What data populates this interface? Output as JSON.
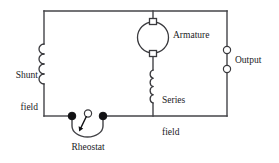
{
  "diagram": {
    "type": "electrical-schematic",
    "background_color": "#ffffff",
    "wire_color": "#444448",
    "ink_color": "#1a1a1e",
    "node_color": "#111114",
    "labels": {
      "shunt_field_line1": "Shunt",
      "shunt_field_line2": "field",
      "armature": "Armature",
      "series_field_line1": "Series",
      "series_field_line2": "field",
      "output": "Output",
      "rheostat": "Rheostat"
    },
    "components": [
      {
        "name": "shunt-field-coil",
        "label": "Shunt field",
        "kind": "inductor-coil",
        "turns": 4,
        "orientation": "vertical",
        "bump_side": "left"
      },
      {
        "name": "armature",
        "label": "Armature",
        "kind": "armature-circle",
        "brushes": 2,
        "brush_shape": "square"
      },
      {
        "name": "series-field-coil",
        "label": "Series field",
        "kind": "inductor-coil",
        "turns": 4,
        "orientation": "vertical",
        "bump_side": "left"
      },
      {
        "name": "output-terminals",
        "label": "Output",
        "kind": "open-terminals",
        "count": 2
      },
      {
        "name": "rheostat",
        "label": "Rheostat",
        "kind": "variable-resistor-wiper",
        "fixed_nodes": 2,
        "wiper": 1
      }
    ]
  }
}
